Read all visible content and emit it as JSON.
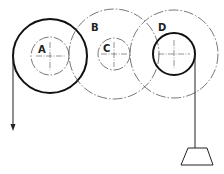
{
  "diagram": {
    "type": "pulley-gear-train",
    "labels": {
      "a": "A",
      "b": "B",
      "c": "C",
      "d": "D"
    },
    "components": [
      {
        "id": "A",
        "description": "wheel A: large solid outer wheel with small dash-dot inner circle",
        "center": [
          50,
          56
        ],
        "outer_radius": 37,
        "inner_radius": 19,
        "outer_style": "solid",
        "inner_style": "dash-dot"
      },
      {
        "id": "B",
        "description": "large dash-dot gear B coaxial with small gear C",
        "center": [
          114,
          54
        ],
        "radius": 45,
        "style": "dash-dot"
      },
      {
        "id": "C",
        "description": "small dash-dot gear C",
        "center": [
          114,
          54
        ],
        "radius": 16,
        "style": "dash-dot"
      },
      {
        "id": "D",
        "description": "large dash-dot gear D with small solid drum",
        "center": [
          174,
          54
        ],
        "outer_radius": 44,
        "inner_radius": 21,
        "outer_style": "dash-dot",
        "inner_style": "solid"
      }
    ],
    "left_rope": {
      "description": "rope hanging from wheel A with downward arrow (applied force)"
    },
    "right_rope": {
      "description": "rope hanging from drum D supporting a load"
    },
    "load": {
      "shape": "trapezoid"
    }
  }
}
